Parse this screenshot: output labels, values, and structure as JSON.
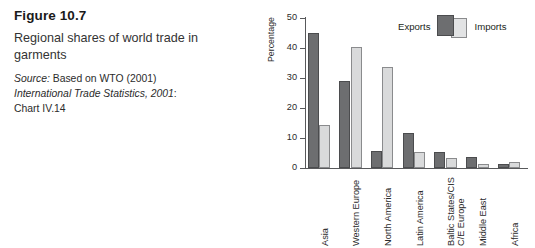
{
  "figure": {
    "title": "Figure 10.7",
    "description": "Regional shares of world trade in garments",
    "source_label": "Source:",
    "source_text": " Based on WTO (2001)",
    "source_italic_line": "International Trade Statistics, 2001",
    "source_line_suffix": ":",
    "source_line3": "Chart IV.14"
  },
  "legend": {
    "exports_label": "Exports",
    "imports_label": "Imports",
    "exports_color": "#6d6e70",
    "imports_color": "#e2e3e4"
  },
  "chart_data": {
    "type": "bar",
    "title": "Regional shares of world trade in garments",
    "xlabel": "",
    "ylabel": "Percentage",
    "ylim": [
      0,
      50
    ],
    "yticks": [
      0,
      10,
      20,
      30,
      40,
      50
    ],
    "ytick_labels": [
      "0",
      "10",
      "20",
      "30",
      "40",
      "50"
    ],
    "grid": false,
    "legend_position": "top-right",
    "categories": [
      "Asia",
      "Western Europe",
      "North America",
      "Latin America",
      "C/E Europe Baltic States/CIS",
      "Middle East",
      "Africa"
    ],
    "category_lines": [
      [
        "Asia"
      ],
      [
        "Western Europe"
      ],
      [
        "North America"
      ],
      [
        "Latin America"
      ],
      [
        "C/E Europe",
        "Baltic States/CIS"
      ],
      [
        "Middle East"
      ],
      [
        "Africa"
      ]
    ],
    "series": [
      {
        "name": "Exports",
        "color": "#6d6e70",
        "values": [
          45.0,
          29.0,
          5.7,
          11.7,
          5.2,
          3.7,
          1.5
        ]
      },
      {
        "name": "Imports",
        "color": "#e2e3e4",
        "values": [
          14.2,
          40.4,
          33.8,
          5.4,
          3.5,
          1.2,
          2.1
        ]
      }
    ]
  }
}
